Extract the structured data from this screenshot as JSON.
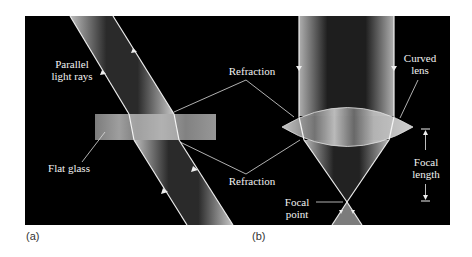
{
  "panel_a": {
    "caption": "(a)",
    "labels": {
      "rays_line1": "Parallel",
      "rays_line2": "light rays",
      "glass": "Flat glass"
    }
  },
  "shared": {
    "refraction_top": "Refraction",
    "refraction_bottom": "Refraction"
  },
  "panel_b": {
    "caption": "(b)",
    "labels": {
      "lens_line1": "Curved",
      "lens_line2": "lens",
      "focal_length_line1": "Focal",
      "focal_length_line2": "length",
      "focal_point_line1": "Focal",
      "focal_point_line2": "point"
    }
  },
  "colors": {
    "background": "#000000",
    "beam_edge": "#e8e8e8",
    "glass": "#9a9a9a",
    "label": "#f2f2f2"
  }
}
